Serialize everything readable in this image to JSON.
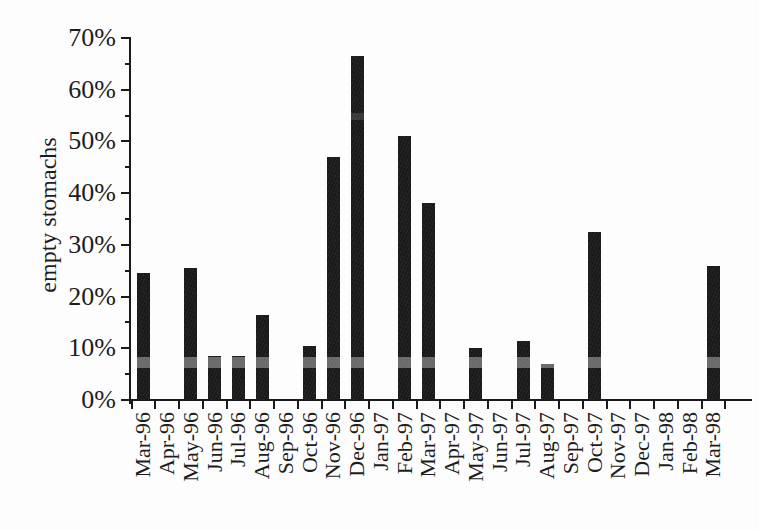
{
  "chart_data": {
    "type": "bar",
    "title": "",
    "xlabel": "",
    "ylabel": "empty stomachs",
    "y_unit": "%",
    "ylim": [
      0,
      70
    ],
    "y_major_tick_step": 10,
    "y_minor_tick_step": 5,
    "y_tick_labels": [
      "0%",
      "10%",
      "20%",
      "30%",
      "40%",
      "50%",
      "60%",
      "70%"
    ],
    "categories": [
      "Mar-96",
      "Apr-96",
      "May-96",
      "Jun-96",
      "Jul-96",
      "Aug-96",
      "Sep-96",
      "Oct-96",
      "Nov-96",
      "Dec-96",
      "Jan-97",
      "Feb-97",
      "Mar-97",
      "Apr-97",
      "May-97",
      "Jun-97",
      "Jul-97",
      "Aug-97",
      "Sep-97",
      "Oct-97",
      "Nov-97",
      "Dec-97",
      "Jan-98",
      "Feb-98",
      "Mar-98"
    ],
    "values": [
      24.5,
      0,
      25.5,
      8.5,
      8.5,
      16.5,
      0,
      10.5,
      47,
      66.5,
      0,
      51,
      38,
      0,
      10,
      0,
      11.5,
      7,
      0,
      32.5,
      0,
      0,
      0,
      0,
      26
    ],
    "grid": false,
    "legend": "none",
    "bar_color": "#1c1c1c",
    "axis_color": "#1a1a1a",
    "text_color": "#1c1c1c",
    "background_color": "#fdfdfd",
    "scan_stripe_color": "rgba(255,255,255,0.35)"
  }
}
